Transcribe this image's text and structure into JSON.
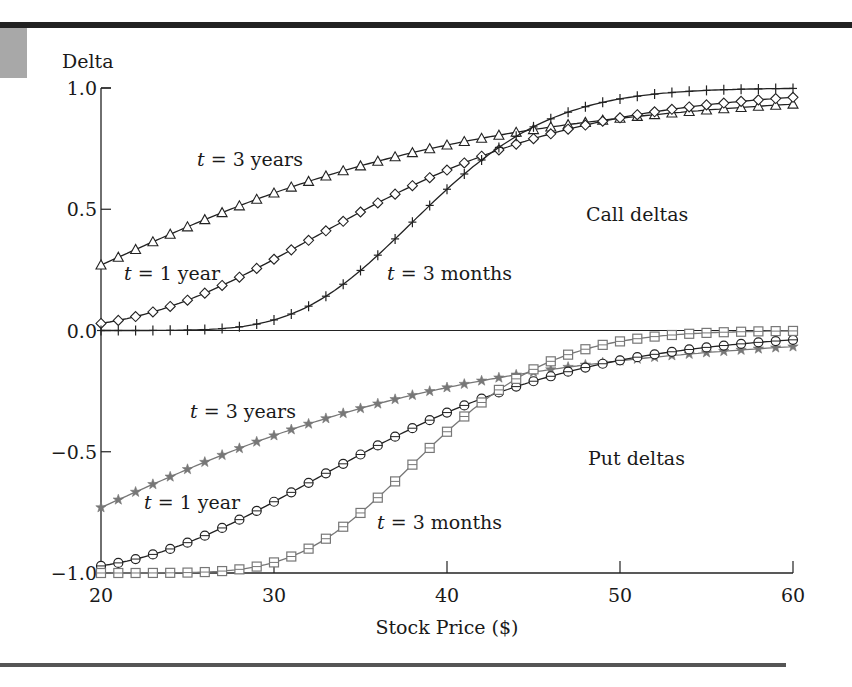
{
  "chart_data": {
    "type": "line",
    "title": "",
    "xlabel": "Stock Price ($)",
    "ylabel": "Delta",
    "xlim": [
      20,
      60
    ],
    "ylim": [
      -1.0,
      1.0
    ],
    "xticks": [
      "20",
      "30",
      "40",
      "50",
      "60"
    ],
    "yticks": [
      "1.0",
      "0.5",
      "0.0",
      "−0.5",
      "−1.0"
    ],
    "grid": false,
    "x": [
      20,
      22,
      24,
      26,
      28,
      30,
      32,
      34,
      36,
      38,
      40,
      42,
      44,
      46,
      48,
      50,
      52,
      54,
      56,
      58,
      60
    ],
    "series": [
      {
        "name": "Call, t = 3 years",
        "marker": "triangle",
        "color": "#222222",
        "values": [
          0.27,
          0.33,
          0.39,
          0.44,
          0.5,
          0.55,
          0.59,
          0.63,
          0.67,
          0.7,
          0.73,
          0.76,
          0.78,
          0.8,
          0.82,
          0.84,
          0.85,
          0.87,
          0.88,
          0.89,
          0.9
        ]
      },
      {
        "name": "Call, t = 1 year",
        "marker": "diamond",
        "color": "#222222",
        "values": [
          0.03,
          0.06,
          0.1,
          0.16,
          0.22,
          0.29,
          0.37,
          0.45,
          0.52,
          0.59,
          0.66,
          0.71,
          0.76,
          0.81,
          0.84,
          0.87,
          0.9,
          0.92,
          0.93,
          0.95,
          0.96
        ]
      },
      {
        "name": "Call, t = 3 months",
        "marker": "cross",
        "color": "#222222",
        "values": [
          0.0,
          0.0,
          0.0,
          0.0,
          0.01,
          0.04,
          0.1,
          0.2,
          0.33,
          0.47,
          0.61,
          0.73,
          0.82,
          0.89,
          0.94,
          0.96,
          0.98,
          0.99,
          0.99,
          1.0,
          1.0
        ]
      },
      {
        "name": "Put, t = 3 years",
        "marker": "star",
        "color": "#777777",
        "values": [
          -0.73,
          -0.67,
          -0.61,
          -0.56,
          -0.5,
          -0.45,
          -0.41,
          -0.37,
          -0.33,
          -0.3,
          -0.27,
          -0.24,
          -0.22,
          -0.2,
          -0.18,
          -0.16,
          -0.15,
          -0.13,
          -0.12,
          -0.11,
          -0.1
        ]
      },
      {
        "name": "Put, t = 1 year",
        "marker": "circle",
        "color": "#222222",
        "values": [
          -0.97,
          -0.94,
          -0.9,
          -0.84,
          -0.78,
          -0.71,
          -0.63,
          -0.55,
          -0.48,
          -0.41,
          -0.34,
          -0.29,
          -0.24,
          -0.19,
          -0.16,
          -0.13,
          -0.1,
          -0.08,
          -0.07,
          -0.05,
          -0.04
        ]
      },
      {
        "name": "Put, t = 3 months",
        "marker": "square",
        "color": "#777777",
        "values": [
          -1.0,
          -1.0,
          -1.0,
          -1.0,
          -0.99,
          -0.96,
          -0.9,
          -0.8,
          -0.67,
          -0.53,
          -0.39,
          -0.27,
          -0.18,
          -0.11,
          -0.06,
          -0.04,
          -0.02,
          -0.01,
          -0.01,
          0.0,
          0.0
        ]
      }
    ],
    "annotations": [
      {
        "text": "t = 3 years",
        "italic_prefix": "t",
        "x": 28.3,
        "y": 0.7
      },
      {
        "text": "t = 1 year",
        "italic_prefix": "t",
        "x": 21.3,
        "y": 0.23
      },
      {
        "text": "t = 3 months",
        "italic_prefix": "t",
        "x": 35.6,
        "y": 0.23
      },
      {
        "text": "Call deltas",
        "x": 47.0,
        "y": 0.46
      },
      {
        "text": "t = 3 years",
        "italic_prefix": "t",
        "x": 25.2,
        "y": -0.33
      },
      {
        "text": "t = 1 year",
        "italic_prefix": "t",
        "x": 22.3,
        "y": -0.73
      },
      {
        "text": "t = 3 months",
        "italic_prefix": "t",
        "x": 36.3,
        "y": -0.81
      },
      {
        "text": "Put deltas",
        "x": 47.2,
        "y": -0.53
      }
    ],
    "model": {
      "strike": 40,
      "sigma": 0.3,
      "rate": 0.08,
      "times": [
        3,
        1,
        0.25
      ],
      "step": 1
    }
  },
  "labels": {
    "ylabel": "Delta",
    "xlabel": "Stock Price ($)",
    "call_region": "Call deltas",
    "put_region": "Put deltas",
    "t3y_call": " = 3 years",
    "t1y_call": " = 1 year",
    "t3m_call": " = 3 months",
    "t3y_put": " = 3 years",
    "t1y_put": " = 1 year",
    "t3m_put": " = 3 months",
    "t": "t"
  }
}
